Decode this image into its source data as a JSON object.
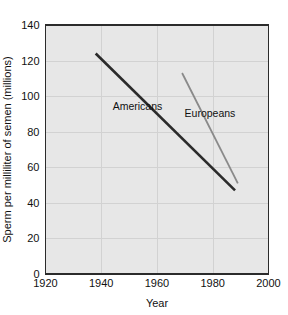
{
  "chart_data": {
    "type": "line",
    "title": "",
    "xlabel": "Year",
    "ylabel": "Sperm per milliliter of semen (millions)",
    "xlim": [
      1920,
      2000
    ],
    "ylim": [
      0,
      140
    ],
    "xticks": [
      1920,
      1940,
      1960,
      1980,
      2000
    ],
    "yticks": [
      0,
      20,
      40,
      60,
      80,
      100,
      120,
      140
    ],
    "xtick_labels": [
      "1920",
      "1940",
      "1960",
      "1980",
      "2000"
    ],
    "ytick_labels": [
      "0",
      "20",
      "40",
      "60",
      "80",
      "100",
      "120",
      "140"
    ],
    "grid": true,
    "legend_position": "inline-annotation",
    "series": [
      {
        "name": "Americans",
        "color": "#2b2b2b",
        "x": [
          1938,
          1988
        ],
        "values": [
          124,
          47
        ],
        "label_text": "Americans",
        "label_x": 1953,
        "label_y": 92
      },
      {
        "name": "Europeans",
        "color": "#8a8a8a",
        "x": [
          1969,
          1989
        ],
        "values": [
          113,
          51
        ],
        "label_text": "Europeans",
        "label_x": 1979,
        "label_y": 88
      }
    ]
  },
  "axes": {
    "x_title": "Year",
    "y_title": "Sperm per milliliter of semen (millions)"
  },
  "colors": {
    "plot_background": "#e7e7e7",
    "page_background": "#ffffff",
    "gridline": "#d2d2d2",
    "axis": "#2b2b2b",
    "americans_line": "#2b2b2b",
    "europeans_line": "#8a8a8a",
    "text": "#111111"
  }
}
